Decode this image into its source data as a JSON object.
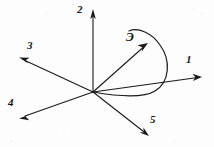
{
  "figure": {
    "background_color": "#fdfdfd",
    "stroke_color": "#1a1a1a",
    "width": 214,
    "height": 147,
    "origin": {
      "x": 93,
      "y": 92
    },
    "labels": {
      "ray1": "1",
      "ray2": "2",
      "ray3": "3",
      "ray4": "4",
      "ray5": "5",
      "curve": "Э"
    },
    "rays": [
      {
        "name": "ray-1",
        "label": "1",
        "from": {
          "x": 93,
          "y": 92
        },
        "to": {
          "x": 201,
          "y": 77
        },
        "label_pos": {
          "x": 186,
          "y": 58
        },
        "direction": "right slightly up"
      },
      {
        "name": "ray-2",
        "label": "2",
        "from": {
          "x": 93,
          "y": 92
        },
        "to": {
          "x": 93,
          "y": 11
        },
        "label_pos": {
          "x": 78,
          "y": 6
        },
        "direction": "up vertical"
      },
      {
        "name": "ray-3",
        "label": "3",
        "from": {
          "x": 93,
          "y": 92
        },
        "to": {
          "x": 20,
          "y": 58
        },
        "label_pos": {
          "x": 27,
          "y": 44
        },
        "direction": "up left"
      },
      {
        "name": "ray-4",
        "label": "4",
        "from": {
          "x": 93,
          "y": 92
        },
        "to": {
          "x": 20,
          "y": 118
        },
        "label_pos": {
          "x": 9,
          "y": 100
        },
        "direction": "down left"
      },
      {
        "name": "ray-5",
        "label": "5",
        "from": {
          "x": 93,
          "y": 92
        },
        "to": {
          "x": 148,
          "y": 136
        },
        "label_pos": {
          "x": 151,
          "y": 117
        },
        "direction": "down right"
      },
      {
        "name": "ray-curve",
        "label": "Э",
        "from": {
          "x": 93,
          "y": 92
        },
        "to": {
          "x": 148,
          "y": 44
        },
        "label_pos": {
          "x": 127,
          "y": 33
        },
        "direction": "up right into loop"
      }
    ],
    "curve": {
      "name": "looping-curve",
      "description": "open loop sweeping from origin rightward, around clockwise and back over the top",
      "start": {
        "x": 93,
        "y": 92
      },
      "end": {
        "x": 129,
        "y": 31
      }
    }
  }
}
